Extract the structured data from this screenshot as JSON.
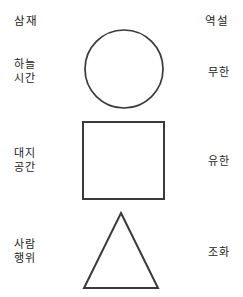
{
  "diagram": {
    "title_left": "삼재",
    "title_right": "역설",
    "background_color": "#ffffff",
    "stroke_color": "#3a3a3a",
    "text_color": "#1c1c1c",
    "rows": [
      {
        "left": "하늘\n시간",
        "shape": "circle",
        "right": "무한"
      },
      {
        "left": "대지\n공간",
        "shape": "square",
        "right": "유한"
      },
      {
        "left": "사람\n행위",
        "shape": "triangle",
        "right": "조화"
      }
    ]
  }
}
